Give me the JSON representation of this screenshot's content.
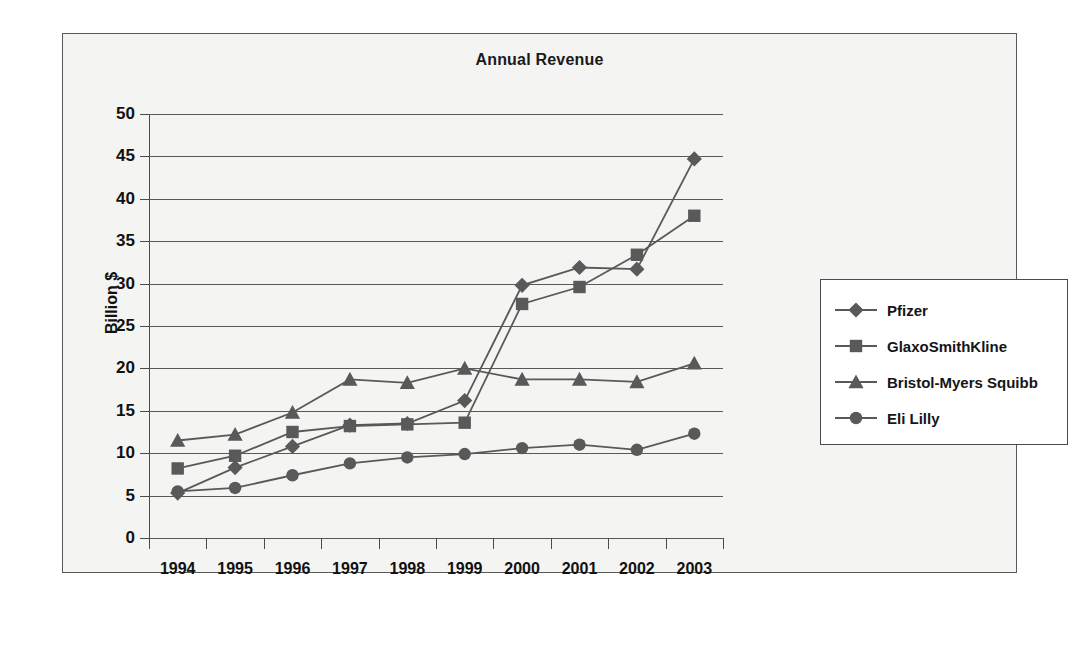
{
  "chart_data": {
    "type": "line",
    "title": "Annual Revenue",
    "xlabel": "",
    "ylabel": "Billion $",
    "categories": [
      "1994",
      "1995",
      "1996",
      "1997",
      "1998",
      "1999",
      "2000",
      "2001",
      "2002",
      "2003"
    ],
    "ylim": [
      0,
      50
    ],
    "yticks": [
      "0",
      "5",
      "10",
      "15",
      "20",
      "25",
      "30",
      "35",
      "40",
      "45",
      "50"
    ],
    "grid": true,
    "legend_position": "right",
    "series": [
      {
        "name": "Pfizer",
        "marker": "diamond",
        "color": "#595959",
        "values": [
          5.3,
          8.3,
          10.8,
          13.3,
          13.5,
          16.2,
          29.8,
          31.9,
          31.7,
          44.7
        ]
      },
      {
        "name": "GlaxoSmithKline",
        "marker": "square",
        "color": "#595959",
        "values": [
          8.2,
          9.7,
          12.5,
          13.2,
          13.4,
          13.6,
          27.6,
          29.6,
          33.4,
          38.0
        ]
      },
      {
        "name": "Bristol-Myers Squibb",
        "marker": "triangle",
        "color": "#595959",
        "values": [
          11.5,
          12.2,
          14.8,
          18.7,
          18.3,
          20.0,
          18.7,
          18.7,
          18.4,
          20.6
        ]
      },
      {
        "name": "Eli Lilly",
        "marker": "circle",
        "color": "#595959",
        "values": [
          5.5,
          5.9,
          7.4,
          8.8,
          9.5,
          9.9,
          10.6,
          11.0,
          10.4,
          12.3
        ]
      }
    ]
  }
}
